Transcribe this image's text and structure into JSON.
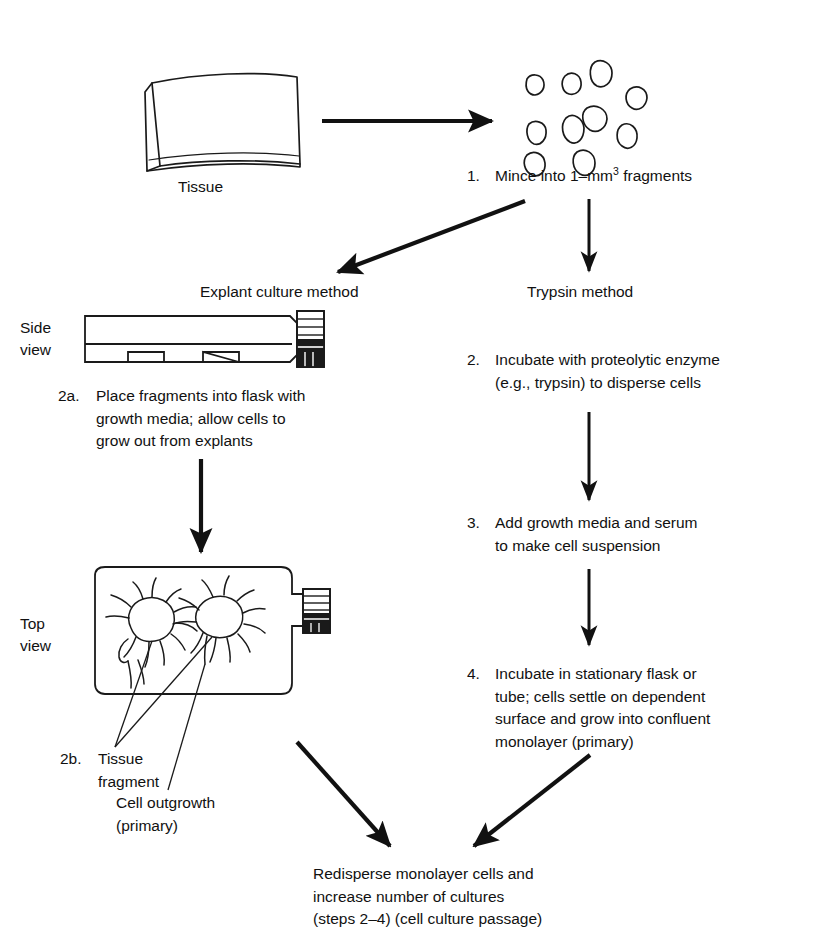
{
  "figure": {
    "title_present": false,
    "type": "flowchart-diagram"
  },
  "labels": {
    "tissue": "Tissue",
    "explant_method": "Explant culture method",
    "trypsin_method": "Trypsin method",
    "side_view_line1": "Side",
    "side_view_line2": "view",
    "top_view_line1": "Top",
    "top_view_line2": "view"
  },
  "steps": {
    "step1": {
      "number": "1.",
      "text_before_sup": "Mince into 1–mm",
      "superscript": "3",
      "text_after_sup": " fragments"
    },
    "step2a": {
      "number": "2a.",
      "text": "Place fragments into flask with\ngrowth media; allow cells to\ngrow out from explants"
    },
    "step2b": {
      "number": "2b.",
      "text": "Tissue\n   fragment"
    },
    "step2": {
      "number": "2.",
      "text": "Incubate with proteolytic enzyme\n(e.g., trypsin) to disperse cells"
    },
    "step3": {
      "number": "3.",
      "text": "Add growth media and serum\nto make cell suspension"
    },
    "step4": {
      "number": "4.",
      "text": "Incubate in stationary flask or\ntube; cells settle on dependent\nsurface and grow into confluent\nmonolayer (primary)"
    }
  },
  "annotations": {
    "cell_outgrowth": "Cell outgrowth\n(primary)"
  },
  "footer": {
    "text": "Redisperse monolayer cells and\nincrease number of cultures\n(steps 2–4) (cell culture passage)"
  },
  "colors": {
    "ink": "#111111",
    "background": "#ffffff",
    "stroke": "#1a1a1a"
  }
}
